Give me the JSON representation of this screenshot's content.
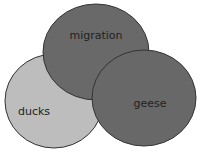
{
  "diagram": {
    "type": "venn",
    "sets": [
      {
        "id": "ducks",
        "label": "ducks",
        "color": "#bdbdbd",
        "cx": 54,
        "cy": 101,
        "rx": 49,
        "ry": 47,
        "label_x": 34,
        "label_y": 115
      },
      {
        "id": "migration",
        "label": "migration",
        "color": "#696969",
        "cx": 96,
        "cy": 52,
        "rx": 53,
        "ry": 48,
        "label_x": 96,
        "label_y": 39
      },
      {
        "id": "geese",
        "label": "geese",
        "color": "#686868",
        "cx": 144,
        "cy": 98,
        "rx": 52,
        "ry": 48,
        "label_x": 150,
        "label_y": 107
      }
    ],
    "stroke_color": "#333333"
  }
}
